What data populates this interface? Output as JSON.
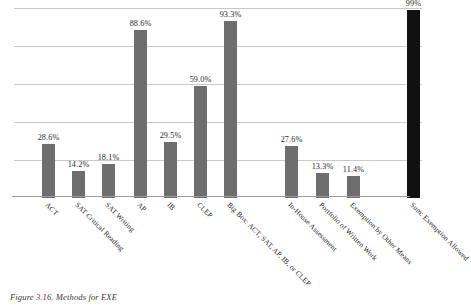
{
  "caption": "Figure 3.16. Methods for EXE",
  "chart_data": {
    "type": "bar",
    "title": "",
    "xlabel": "",
    "ylabel": "",
    "ylim": [
      0,
      100
    ],
    "grid": true,
    "gridlines": [
      20,
      40,
      60,
      80,
      100
    ],
    "legend": "none",
    "categories": [
      "ACT",
      "SAT Critical Reading",
      "SAT Writing",
      "AP",
      "IB",
      "CLEP",
      "Big Box: ACT, SAT, AP, IB, or CLEP",
      "In-House Assessment",
      "Portfolio of Written Work",
      "Exemption by Other Means",
      "Sum: Exemption Allowed"
    ],
    "values": [
      28.6,
      14.2,
      18.1,
      88.6,
      29.5,
      59.0,
      93.3,
      27.6,
      13.3,
      11.4,
      99
    ],
    "data_labels": [
      "28.6%",
      "14.2%",
      "18.1%",
      "88.6%",
      "29.5%",
      "59.0%",
      "93.3%",
      "27.6%",
      "13.3%",
      "11.4%",
      "99%"
    ],
    "bar_colors": [
      "#6e6e6e",
      "#6e6e6e",
      "#6e6e6e",
      "#6e6e6e",
      "#6e6e6e",
      "#6e6e6e",
      "#6e6e6e",
      "#6e6e6e",
      "#6e6e6e",
      "#6e6e6e",
      "#111111"
    ],
    "x_positions": [
      28,
      58,
      88,
      120,
      150,
      180,
      210,
      271,
      302,
      333,
      393
    ],
    "accent_color": "#6e6e6e",
    "highlight_color": "#111111",
    "gridline_color": "#c9c9c9",
    "axis_color": "#9a9a9a"
  }
}
